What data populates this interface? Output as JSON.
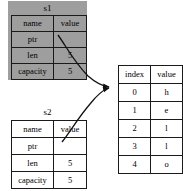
{
  "diagram": {
    "structs": [
      {
        "id": "s1",
        "title": "s1",
        "highlighted": true,
        "header": {
          "key": "name",
          "value": "value"
        },
        "rows": [
          {
            "key": "ptr",
            "value": ""
          },
          {
            "key": "len",
            "value": "5"
          },
          {
            "key": "capacity",
            "value": "5"
          }
        ]
      },
      {
        "id": "s2",
        "title": "s2",
        "highlighted": false,
        "header": {
          "key": "name",
          "value": "value"
        },
        "rows": [
          {
            "key": "ptr",
            "value": ""
          },
          {
            "key": "len",
            "value": "5"
          },
          {
            "key": "capacity",
            "value": "5"
          }
        ]
      }
    ],
    "buffer": {
      "header": {
        "index": "index",
        "value": "value"
      },
      "rows": [
        {
          "index": "0",
          "value": "h"
        },
        {
          "index": "1",
          "value": "e"
        },
        {
          "index": "2",
          "value": "l"
        },
        {
          "index": "3",
          "value": "l"
        },
        {
          "index": "4",
          "value": "o"
        }
      ]
    },
    "pointers": [
      {
        "from": "s1.ptr",
        "to": "buffer.row0"
      },
      {
        "from": "s2.ptr",
        "to": "buffer.row0"
      }
    ],
    "colors": {
      "highlight_fill": "#9e9e9e",
      "border": "#1a1a1a",
      "background": "#ffffff",
      "text": "#000000"
    }
  }
}
